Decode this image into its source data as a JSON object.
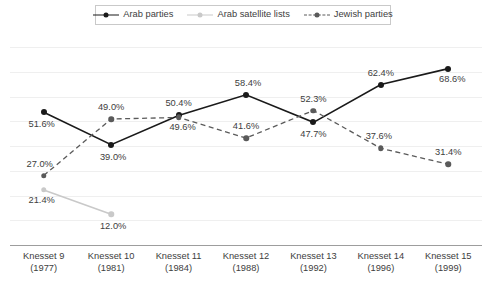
{
  "chart_data": {
    "type": "line",
    "title": "",
    "subtitle": "",
    "xlabel": "",
    "ylabel": "",
    "ylim": [
      0,
      77
    ],
    "grid": true,
    "legend_position": "top",
    "categories": [
      "Knesset 9\n(1977)",
      "Knesset 10\n(1981)",
      "Knesset 11\n(1984)",
      "Knesset 12\n(1988)",
      "Knesset 13\n(1992)",
      "Knesset 14\n(1996)",
      "Knesset 15\n(1999)"
    ],
    "series": [
      {
        "name": "Arab parties",
        "color": "#1a1a1a",
        "style": "solid",
        "values": [
          51.6,
          39.0,
          50.4,
          58.4,
          47.7,
          62.4,
          68.6
        ],
        "labels": [
          "51.6%",
          "39.0%",
          "50.4%",
          "58.4%",
          "47.7%",
          "62.4%",
          "68.6%"
        ]
      },
      {
        "name": "Arab satellite lists",
        "color": "#c9c9c9",
        "style": "solid",
        "values": [
          21.4,
          12.0,
          null,
          null,
          null,
          null,
          null
        ],
        "labels": [
          "21.4%",
          "12.0%",
          "",
          "",
          "",
          "",
          ""
        ]
      },
      {
        "name": "Jewish parties",
        "color": "#5a5a5a",
        "style": "dashed",
        "values": [
          27.0,
          49.0,
          49.6,
          41.6,
          52.3,
          37.6,
          31.4
        ],
        "labels": [
          "27.0%",
          "49.0%",
          "49.6%",
          "41.6%",
          "52.3%",
          "37.6%",
          "31.4%"
        ]
      }
    ]
  },
  "legend": {
    "items": [
      {
        "label": "Arab parties",
        "marker": "circle-marker-black",
        "line": "solid"
      },
      {
        "label": "Arab satellite lists",
        "marker": "circle-marker-lightgray",
        "line": "solid"
      },
      {
        "label": "Jewish parties",
        "marker": "circle-marker-darkgray",
        "line": "dashed"
      }
    ]
  },
  "xaxis": {
    "ticks": [
      {
        "line1": "Knesset 9",
        "line2": "(1977)"
      },
      {
        "line1": "Knesset 10",
        "line2": "(1981)"
      },
      {
        "line1": "Knesset 11",
        "line2": "(1984)"
      },
      {
        "line1": "Knesset 12",
        "line2": "(1988)"
      },
      {
        "line1": "Knesset 13",
        "line2": "(1992)"
      },
      {
        "line1": "Knesset 14",
        "line2": "(1996)"
      },
      {
        "line1": "Knesset 15",
        "line2": "(1999)"
      }
    ]
  }
}
